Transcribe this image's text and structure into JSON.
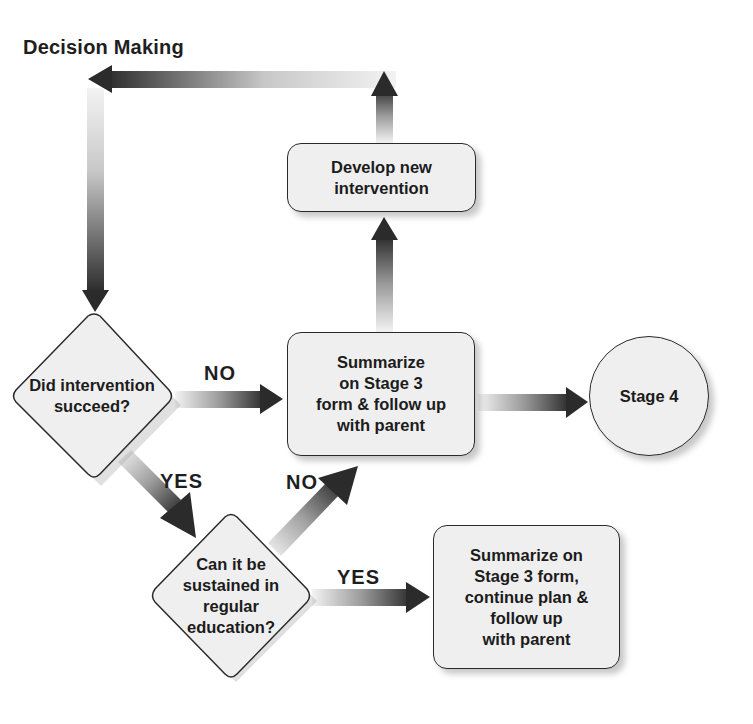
{
  "title": "Decision Making",
  "nodes": {
    "develop": "Develop new\nintervention",
    "did_succeed": "Did intervention\nsucceed?",
    "summarize_followup": "Summarize\non Stage 3\nform & follow up\nwith parent",
    "stage4": "Stage 4",
    "sustained": "Can it be\nsustained in\nregular\neducation?",
    "summarize_continue": "Summarize on\nStage 3 form,\ncontinue plan &\nfollow up\nwith parent"
  },
  "labels": {
    "no_1": "NO",
    "yes_1": "YES",
    "no_2": "NO",
    "yes_2": "YES"
  },
  "colors": {
    "node_fill": "#efefef",
    "node_border": "#2a2a2a",
    "arrow_dark": "#2b2b2b",
    "arrow_light": "#f2f2f2"
  }
}
